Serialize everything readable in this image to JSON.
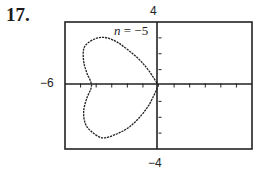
{
  "problem": {
    "number": "17."
  },
  "chart_data": {
    "type": "line",
    "title": "",
    "annotation": "n = −5",
    "parameter": {
      "name": "n",
      "value": -5
    },
    "xlabel": "",
    "ylabel": "",
    "xlim": [
      -6,
      6
    ],
    "ylim": [
      -4,
      4
    ],
    "window_labels": {
      "top": "4",
      "left": "−6",
      "bottom": "−4"
    },
    "grid": false,
    "legend": "none",
    "axes_ticks": {
      "x_step": 1,
      "y_step": 1
    },
    "points": [
      [
        0,
        0
      ],
      [
        -0.6,
        0.9
      ],
      [
        -1.2,
        1.6
      ],
      [
        -1.9,
        2.2
      ],
      [
        -2.6,
        2.7
      ],
      [
        -3.3,
        3.0
      ],
      [
        -3.9,
        3.0
      ],
      [
        -4.5,
        2.7
      ],
      [
        -4.8,
        2.3
      ],
      [
        -4.8,
        1.5
      ],
      [
        -4.6,
        0.8
      ],
      [
        -4.3,
        0
      ],
      [
        -4.6,
        -0.8
      ],
      [
        -4.8,
        -1.6
      ],
      [
        -4.7,
        -2.4
      ],
      [
        -4.3,
        -2.9
      ],
      [
        -3.6,
        -3.3
      ],
      [
        -2.8,
        -3.1
      ],
      [
        -2.0,
        -2.7
      ],
      [
        -1.3,
        -2.1
      ],
      [
        -0.6,
        -1.2
      ],
      [
        0,
        0
      ]
    ]
  },
  "labels": {
    "n_symbol": "n",
    "n_equals": " = −5",
    "top": "4",
    "left": "−6",
    "bottom": "−4"
  }
}
